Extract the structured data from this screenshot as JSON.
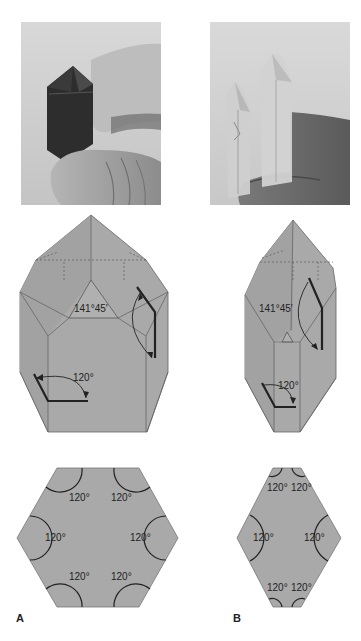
{
  "figure": {
    "panels": [
      {
        "id": "A",
        "label": "A",
        "photo_desc": "dark smoky quartz crystal held between fingers",
        "prism_angle_label": "141°45′",
        "interfacial_angle_label": "120°",
        "cross_section_angles": [
          "120°",
          "120°",
          "120°",
          "120°",
          "120°",
          "120°"
        ]
      },
      {
        "id": "B",
        "label": "B",
        "photo_desc": "clear quartz crystals held against fingers",
        "prism_angle_label": "141°45′",
        "interfacial_angle_label": "120°",
        "cross_section_angles": [
          "120°",
          "120°",
          "120°",
          "120°",
          "120°",
          "120°"
        ]
      }
    ],
    "colors": {
      "crystal_fill": "#a9a9a9",
      "crystal_fill_dark": "#9e9e9e",
      "edge": "#555555",
      "arc": "#222222",
      "background": "#ffffff"
    }
  }
}
